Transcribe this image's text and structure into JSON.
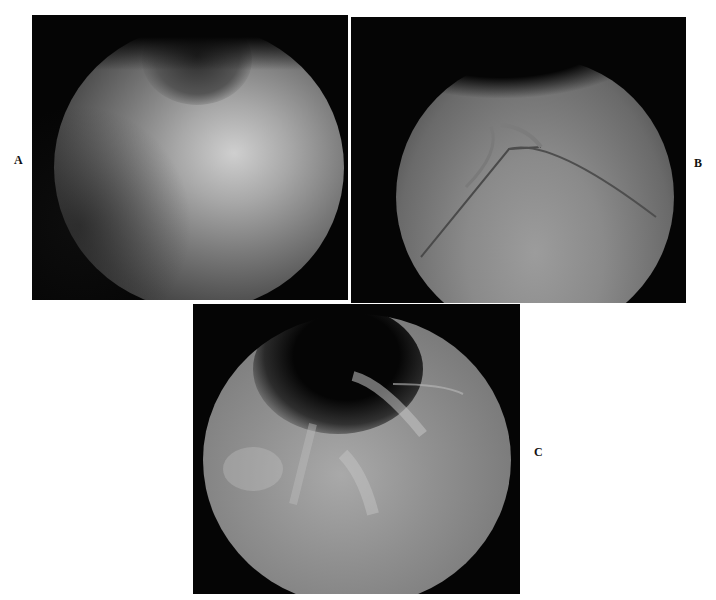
{
  "figure": {
    "panels": [
      {
        "id": "A",
        "label": "A",
        "description": "Endoscopic view A"
      },
      {
        "id": "B",
        "label": "B",
        "description": "Endoscopic view B"
      },
      {
        "id": "C",
        "label": "C",
        "description": "Endoscopic view C"
      }
    ]
  }
}
